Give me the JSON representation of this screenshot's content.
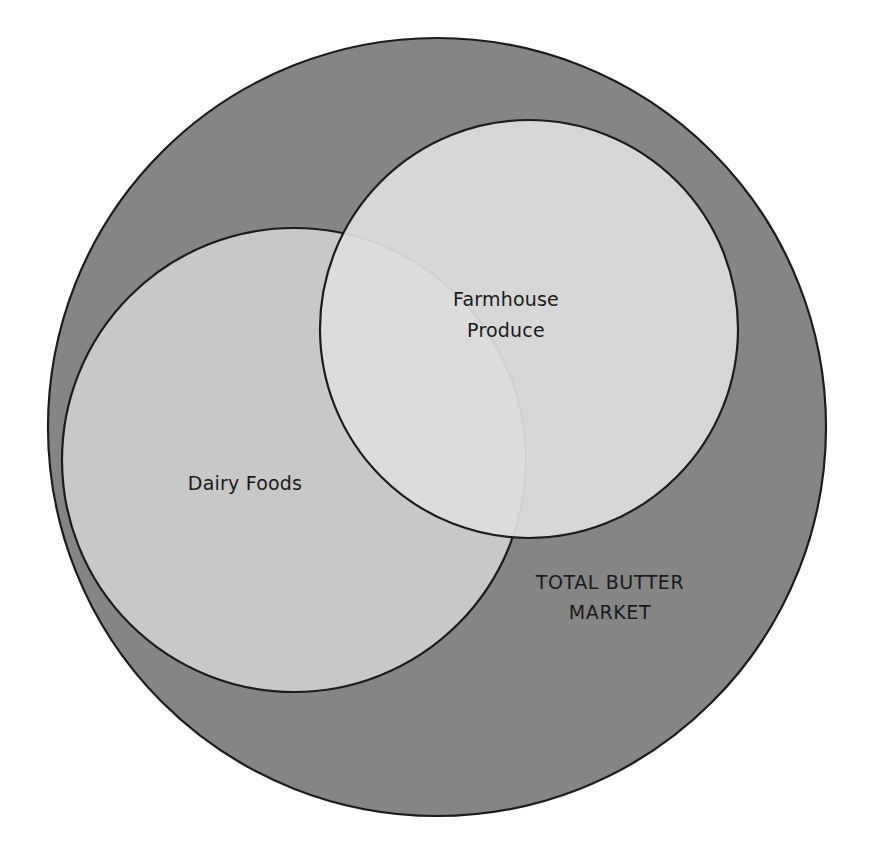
{
  "diagram": {
    "type": "venn-diagram",
    "background_color": "#ffffff",
    "stroke_color": "#1c1c1c",
    "sets": [
      {
        "id": "total-butter-market",
        "label_line1": "TOTAL BUTTER",
        "label_line2": "MARKET",
        "label_full": "TOTAL BUTTER MARKET",
        "fill_color": "#858585",
        "role": "universe",
        "cx": 437,
        "cy": 427,
        "r": 389,
        "label_x": 610,
        "label_y": 583
      },
      {
        "id": "dairy-foods",
        "label_line1": "Dairy Foods",
        "label_line2": "",
        "label_full": "Dairy Foods",
        "fill_color": "#c8c8c8",
        "role": "subset",
        "cx": 294,
        "cy": 460,
        "r": 232,
        "label_x": 245,
        "label_y": 484
      },
      {
        "id": "farmhouse-produce",
        "label_line1": "Farmhouse",
        "label_line2": "Produce",
        "label_full": "Farmhouse Produce",
        "fill_color": "#dedede",
        "role": "subset",
        "cx": 529,
        "cy": 329,
        "r": 209,
        "label_x": 506,
        "label_y": 308
      }
    ]
  }
}
